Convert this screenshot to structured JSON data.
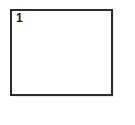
{
  "figure": {
    "panel_label": "1",
    "border_color": "#2b2b2b",
    "background_color": "#ffffff",
    "shadow_color": "#e8e8e8",
    "label_color": "#1a1a1a"
  },
  "page": {
    "background_color": "#ffffff"
  }
}
